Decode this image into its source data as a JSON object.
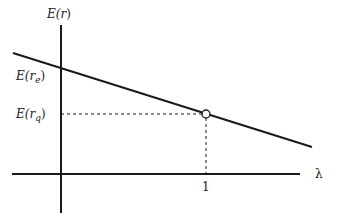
{
  "diagram": {
    "y_axis_label": "E(r)",
    "x_axis_label": "λ",
    "intercept_label": "E(r_e)",
    "point_label": "E(r_q)",
    "x_tick_label": "1",
    "colors": {
      "stroke": "#1a1a1a",
      "background": "#ffffff"
    }
  },
  "labels": {
    "y_axis": {
      "main": "E(",
      "var": "r",
      "close": ")"
    },
    "intercept": {
      "main": "E(",
      "var": "r",
      "sub": "e",
      "close": ")"
    },
    "point": {
      "main": "E(",
      "var": "r",
      "sub": "q",
      "close": ")"
    },
    "x_axis": "λ",
    "tick": "1"
  }
}
